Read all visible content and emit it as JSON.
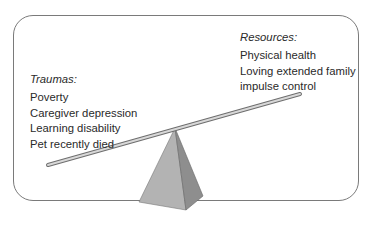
{
  "diagram": {
    "type": "seesaw-balance",
    "traumas": {
      "heading": "Traumas:",
      "items": [
        "Poverty",
        "Caregiver depression",
        "Learning disability",
        "Pet recently died"
      ]
    },
    "resources": {
      "heading": "Resources:",
      "items": [
        "Physical health",
        "Loving extended family",
        "impulse control"
      ]
    },
    "colors": {
      "frame": "#7a7a7a",
      "beam": "#9a9a9a",
      "pyramid_light": "#b0b0b0",
      "pyramid_dark": "#8c8c8c"
    }
  }
}
